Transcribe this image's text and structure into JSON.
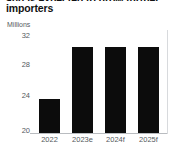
{
  "title": {
    "clipped_line_above": "and is expected to grow further",
    "text": "importers"
  },
  "chart_data": {
    "type": "bar",
    "title": "importers",
    "xlabel": "",
    "ylabel": "Millions",
    "unit_caption": "Millions",
    "categories": [
      "2022",
      "2023e",
      "2024f",
      "2025f"
    ],
    "values": [
      24,
      30,
      30,
      30
    ],
    "series": [
      {
        "name": "Importers",
        "values": [
          24,
          30,
          30,
          30
        ]
      }
    ],
    "ylim": [
      20,
      32
    ],
    "yticks": [
      32,
      28,
      24,
      20
    ],
    "ytick_labels": [
      "32",
      "28",
      "24",
      "20"
    ],
    "grid": false,
    "legend": "none",
    "bar_color": "#0c0c0c",
    "axis_color": "#b9bcc0",
    "tick_label_color": "#55595e"
  }
}
